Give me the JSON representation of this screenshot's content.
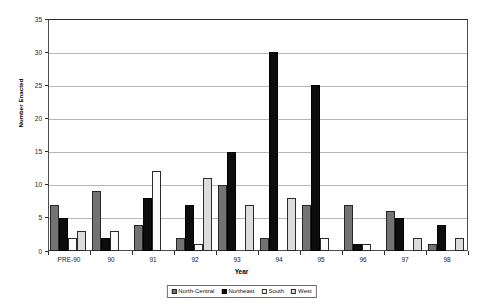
{
  "chart_data": {
    "type": "bar",
    "title": "",
    "xlabel": "Year",
    "ylabel": "Number Enacted",
    "categories": [
      "PRE-90",
      "90",
      "91",
      "92",
      "93",
      "94",
      "95",
      "96",
      "97",
      "98"
    ],
    "series": [
      {
        "name": "North-Central",
        "color": "#737373",
        "values": [
          7,
          9,
          4,
          2,
          10,
          2,
          7,
          7,
          6,
          1
        ]
      },
      {
        "name": "Northeast",
        "color": "#0d0d0d",
        "values": [
          5,
          2,
          8,
          7,
          15,
          30,
          25,
          1,
          5,
          4
        ]
      },
      {
        "name": "South",
        "color": "#fbfbfb",
        "values": [
          2,
          3,
          12,
          1,
          0,
          0,
          2,
          1,
          0,
          0
        ]
      },
      {
        "name": "West",
        "color": "#dcdcdc",
        "values": [
          3,
          0,
          0,
          11,
          7,
          8,
          0,
          0,
          2,
          2
        ]
      }
    ],
    "ylim": [
      0,
      35
    ],
    "ytick_labels": [
      "0",
      "5",
      "10",
      "15",
      "20",
      "25",
      "30",
      "35"
    ],
    "ytick_values": [
      0,
      5,
      10,
      15,
      20,
      25,
      30,
      35
    ],
    "grid": true,
    "legend_position": "bottom",
    "legend_entries": [
      "North-Central",
      "Northeast",
      "South",
      "West"
    ]
  }
}
